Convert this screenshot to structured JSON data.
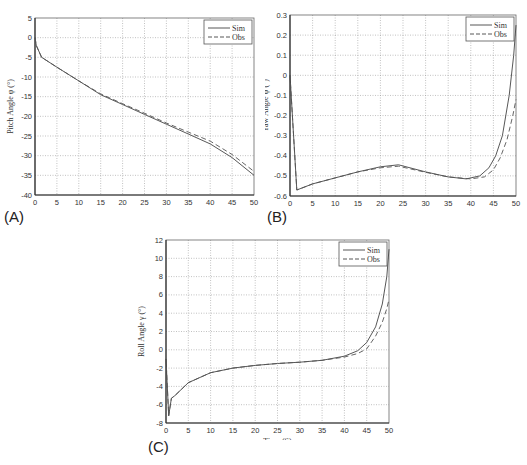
{
  "panels": [
    {
      "label": "(A)"
    },
    {
      "label": "(B)"
    },
    {
      "label": "(C)"
    }
  ],
  "chart_data": [
    {
      "id": "A",
      "type": "line",
      "title": "",
      "xlabel": "Time (S)",
      "ylabel": "Pitch Angle  φ  (°)",
      "xlim": [
        0,
        50
      ],
      "ylim": [
        -40,
        5
      ],
      "xticks": [
        0,
        5,
        10,
        15,
        20,
        25,
        30,
        35,
        40,
        45,
        50
      ],
      "yticks": [
        5,
        0,
        -5,
        -10,
        -15,
        -20,
        -25,
        -30,
        -35,
        -40
      ],
      "grid": true,
      "legend": {
        "position": "upper right",
        "entries": [
          "Sim",
          "Obs"
        ]
      },
      "series": [
        {
          "name": "Sim",
          "style": "solid",
          "x": [
            0,
            0.3,
            1.5,
            5,
            10,
            15,
            20,
            25,
            30,
            35,
            40,
            45,
            50
          ],
          "y": [
            0,
            -2,
            -5,
            -7.5,
            -11,
            -14.5,
            -17,
            -19.5,
            -22,
            -24.5,
            -27,
            -30.5,
            -35
          ]
        },
        {
          "name": "Obs",
          "style": "dashed",
          "x": [
            0,
            0.3,
            1.5,
            5,
            10,
            15,
            20,
            25,
            30,
            35,
            40,
            45,
            50
          ],
          "y": [
            0,
            -2,
            -5,
            -7.5,
            -11,
            -14.3,
            -16.8,
            -19.2,
            -21.7,
            -24,
            -26.3,
            -29.7,
            -34
          ]
        }
      ]
    },
    {
      "id": "B",
      "type": "line",
      "title": "",
      "xlabel": "Time (S)",
      "ylabel": "Yaw Angle  ψ  (°)",
      "xlim": [
        0,
        50
      ],
      "ylim": [
        -0.6,
        0.3
      ],
      "xticks": [
        0,
        5,
        10,
        15,
        20,
        25,
        30,
        35,
        40,
        45,
        50
      ],
      "yticks": [
        0.3,
        0.2,
        0.1,
        0,
        -0.1,
        -0.2,
        -0.3,
        -0.4,
        -0.5,
        -0.6
      ],
      "grid": true,
      "legend": {
        "position": "upper right",
        "entries": [
          "Sim",
          "Obs"
        ]
      },
      "series": [
        {
          "name": "Sim",
          "style": "solid",
          "x": [
            0,
            1.5,
            5,
            10,
            15,
            20,
            24,
            30,
            35,
            39,
            42,
            44,
            45.5,
            47,
            48.5,
            49.5,
            50
          ],
          "y": [
            0,
            -0.57,
            -0.54,
            -0.51,
            -0.48,
            -0.455,
            -0.445,
            -0.48,
            -0.505,
            -0.515,
            -0.5,
            -0.46,
            -0.4,
            -0.3,
            -0.1,
            0.1,
            0.25
          ]
        },
        {
          "name": "Obs",
          "style": "dashed",
          "x": [
            0,
            1.5,
            5,
            10,
            15,
            20,
            24,
            30,
            35,
            40,
            43,
            45,
            46.5,
            48,
            49.3,
            50
          ],
          "y": [
            0,
            -0.57,
            -0.54,
            -0.51,
            -0.48,
            -0.46,
            -0.452,
            -0.482,
            -0.505,
            -0.515,
            -0.505,
            -0.47,
            -0.41,
            -0.32,
            -0.2,
            -0.12
          ]
        }
      ]
    },
    {
      "id": "C",
      "type": "line",
      "title": "",
      "xlabel": "Time (S)",
      "ylabel": "Roll Angle  γ  (°)",
      "xlim": [
        0,
        50
      ],
      "ylim": [
        -8,
        12
      ],
      "xticks": [
        0,
        5,
        10,
        15,
        20,
        25,
        30,
        35,
        40,
        45,
        50
      ],
      "yticks": [
        12,
        10,
        8,
        6,
        4,
        2,
        0,
        -2,
        -4,
        -6,
        -8
      ],
      "grid": true,
      "legend": {
        "position": "upper right",
        "entries": [
          "Sim",
          "Obs"
        ]
      },
      "series": [
        {
          "name": "Sim",
          "style": "solid",
          "x": [
            0,
            0.6,
            1.2,
            2,
            5,
            10,
            15,
            20,
            25,
            30,
            35,
            40,
            43,
            45,
            47,
            48.5,
            49.5,
            50
          ],
          "y": [
            -1,
            -7.2,
            -5.3,
            -5,
            -3.6,
            -2.5,
            -2,
            -1.7,
            -1.5,
            -1.35,
            -1.15,
            -0.7,
            -0.1,
            0.8,
            2.5,
            5,
            8,
            11
          ]
        },
        {
          "name": "Obs",
          "style": "dashed",
          "x": [
            0,
            0.6,
            1.2,
            2,
            5,
            10,
            15,
            20,
            25,
            30,
            35,
            40,
            43,
            45,
            47,
            48.5,
            49.5,
            50
          ],
          "y": [
            -1,
            -7.2,
            -5.3,
            -5,
            -3.6,
            -2.5,
            -2,
            -1.7,
            -1.5,
            -1.35,
            -1.15,
            -0.8,
            -0.4,
            0.1,
            1.5,
            3,
            4.5,
            5.5
          ]
        }
      ]
    }
  ]
}
